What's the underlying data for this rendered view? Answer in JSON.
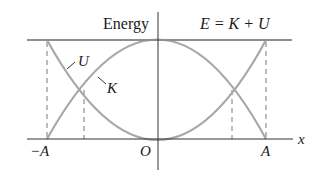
{
  "diagram": {
    "title": "Energy",
    "equation": "E = K + U",
    "curves": [
      {
        "name": "U",
        "label": "U",
        "shape": "parabola, max at ±A, zero at O"
      },
      {
        "name": "K",
        "label": "K",
        "shape": "inverted parabola, max at O, zero at ±A"
      },
      {
        "name": "E",
        "label": "E = K + U",
        "shape": "horizontal line (constant)"
      }
    ],
    "axis_labels": {
      "x": "x",
      "y": "Energy",
      "origin": "O",
      "left_amplitude": "−A",
      "right_amplitude": "A"
    },
    "dashed_markers": [
      "−A",
      "−A/√2",
      "A/√2",
      "A"
    ],
    "colors": {
      "curve": "#a8a8a8",
      "axis": "#333333",
      "total_energy_line": "#8f8f8f",
      "text": "#1a1a1a"
    }
  }
}
